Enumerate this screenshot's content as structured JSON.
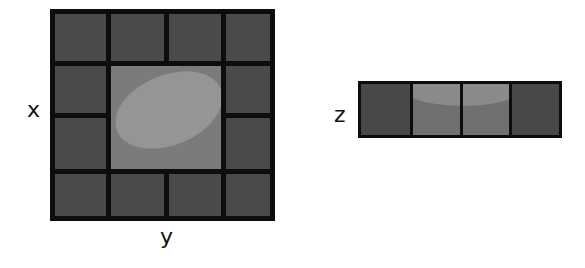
{
  "diagram": {
    "left_panel": {
      "rows": 4,
      "cols": 4,
      "center_region": "2x2 merged lighter cell containing a tilted ellipse",
      "axis_label_vertical": "x",
      "axis_label_horizontal": "y"
    },
    "right_panel": {
      "cells": 4,
      "highlighted_cells": [
        2,
        3
      ],
      "axis_label": "z"
    },
    "colors": {
      "border": "#0d0d0d",
      "outer_cell": "#4a4a4a",
      "center_cell": "#7b7b7b",
      "ellipse": "#959595",
      "strip_mid_cell": "#707070",
      "strip_cap": "#8a8a8a"
    }
  }
}
